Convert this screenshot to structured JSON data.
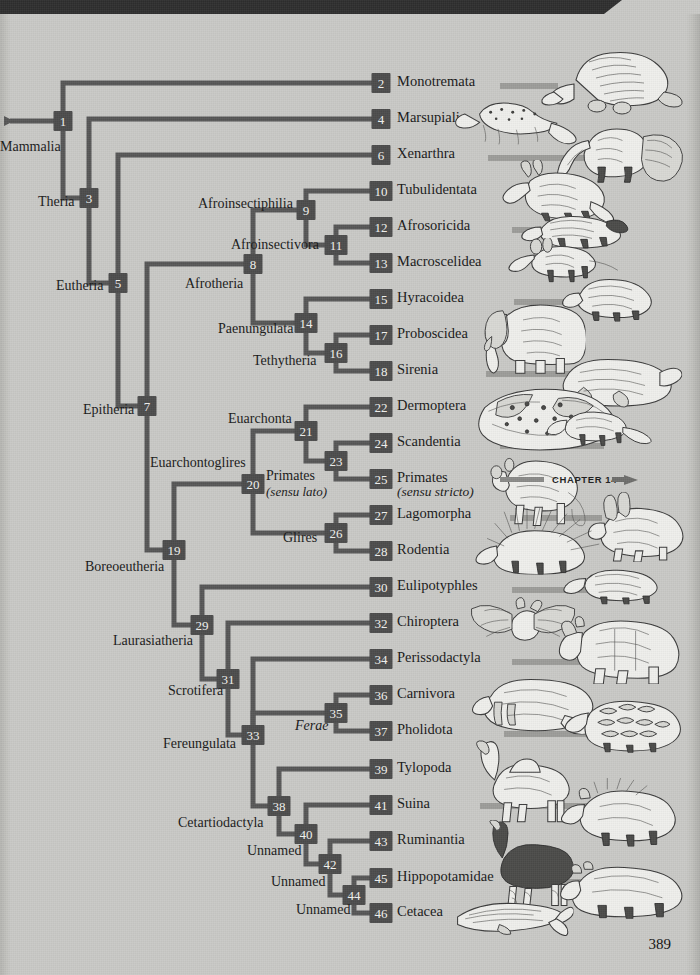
{
  "page": {
    "number": "389",
    "background_color": "#c9c9c6",
    "node_color": "#4b4b4b",
    "branch_color": "#565656"
  },
  "root": {
    "label": "Mammalia"
  },
  "chapter_pointer": {
    "label": "CHAPTER 14"
  },
  "chart_data": {
    "type": "diagram",
    "subtype": "cladogram",
    "leaf_spacing_px": 36,
    "nodes": [
      {
        "id": "1",
        "clade": "Mammalia",
        "type": "internal",
        "x": 63,
        "y": 121,
        "children": [
          "2",
          "3"
        ]
      },
      {
        "id": "2",
        "clade": "Monotremata",
        "type": "leaf",
        "x": 381,
        "y": 83
      },
      {
        "id": "3",
        "clade": "Theria",
        "type": "internal",
        "x": 89,
        "y": 198,
        "children": [
          "4",
          "5"
        ]
      },
      {
        "id": "4",
        "clade": "Marsupialia",
        "type": "leaf",
        "x": 381,
        "y": 119
      },
      {
        "id": "5",
        "clade": "Eutheria",
        "type": "internal",
        "x": 118,
        "y": 283,
        "children": [
          "6",
          "7"
        ]
      },
      {
        "id": "6",
        "clade": "Xenarthra",
        "type": "leaf",
        "x": 381,
        "y": 155
      },
      {
        "id": "7",
        "clade": "Epitheria",
        "type": "internal",
        "x": 147,
        "y": 406,
        "children": [
          "8",
          "19"
        ]
      },
      {
        "id": "8",
        "clade": "Afrotheria",
        "type": "internal",
        "x": 253,
        "y": 264,
        "children": [
          "9",
          "14"
        ]
      },
      {
        "id": "9",
        "clade": "Afroinsectiphilia",
        "type": "internal",
        "x": 306,
        "y": 210,
        "children": [
          "10",
          "11"
        ]
      },
      {
        "id": "10",
        "clade": "Tubulidentata",
        "type": "leaf",
        "x": 381,
        "y": 191
      },
      {
        "id": "11",
        "clade": "Afroinsectivora",
        "type": "internal",
        "x": 336,
        "y": 245,
        "children": [
          "12",
          "13"
        ]
      },
      {
        "id": "12",
        "clade": "Afrosoricida",
        "type": "leaf",
        "x": 381,
        "y": 227
      },
      {
        "id": "13",
        "clade": "Macroscelidea",
        "type": "leaf",
        "x": 381,
        "y": 263
      },
      {
        "id": "14",
        "clade": "Paenungulata",
        "type": "internal",
        "x": 306,
        "y": 323,
        "children": [
          "15",
          "16"
        ]
      },
      {
        "id": "15",
        "clade": "Hyracoidea",
        "type": "leaf",
        "x": 381,
        "y": 299
      },
      {
        "id": "16",
        "clade": "Tethytheria",
        "type": "internal",
        "x": 336,
        "y": 353,
        "children": [
          "17",
          "18"
        ]
      },
      {
        "id": "17",
        "clade": "Proboscidea",
        "type": "leaf",
        "x": 381,
        "y": 335
      },
      {
        "id": "18",
        "clade": "Sirenia",
        "type": "leaf",
        "x": 381,
        "y": 371
      },
      {
        "id": "19",
        "clade": "Boreoeutheria",
        "type": "internal",
        "x": 174,
        "y": 550,
        "children": [
          "20",
          "29"
        ]
      },
      {
        "id": "20",
        "clade": "Euarchontoglires",
        "type": "internal",
        "x": 253,
        "y": 484,
        "children": [
          "21",
          "26"
        ]
      },
      {
        "id": "21",
        "clade": "Euarchonta",
        "type": "internal",
        "x": 306,
        "y": 431,
        "children": [
          "22",
          "23"
        ]
      },
      {
        "id": "22",
        "clade": "Dermoptera",
        "type": "leaf",
        "x": 381,
        "y": 407
      },
      {
        "id": "23",
        "clade": "Primates (sensu lato)",
        "type": "internal",
        "x": 336,
        "y": 461,
        "children": [
          "24",
          "25"
        ]
      },
      {
        "id": "24",
        "clade": "Scandentia",
        "type": "leaf",
        "x": 381,
        "y": 443
      },
      {
        "id": "25",
        "clade": "Primates (sensu stricto)",
        "type": "leaf",
        "x": 381,
        "y": 479
      },
      {
        "id": "26",
        "clade": "Glires",
        "type": "internal",
        "x": 336,
        "y": 533,
        "children": [
          "27",
          "28"
        ]
      },
      {
        "id": "27",
        "clade": "Lagomorpha",
        "type": "leaf",
        "x": 381,
        "y": 515
      },
      {
        "id": "28",
        "clade": "Rodentia",
        "type": "leaf",
        "x": 381,
        "y": 551
      },
      {
        "id": "29",
        "clade": "Laurasiatheria",
        "type": "internal",
        "x": 202,
        "y": 625,
        "children": [
          "30",
          "31"
        ]
      },
      {
        "id": "30",
        "clade": "Eulipotyphles",
        "type": "leaf",
        "x": 381,
        "y": 587
      },
      {
        "id": "31",
        "clade": "Scrotifera",
        "type": "internal",
        "x": 228,
        "y": 679,
        "children": [
          "32",
          "33"
        ]
      },
      {
        "id": "32",
        "clade": "Chiroptera",
        "type": "leaf",
        "x": 381,
        "y": 623
      },
      {
        "id": "33",
        "clade": "Fereungulata",
        "type": "internal",
        "x": 253,
        "y": 735,
        "children": [
          "34",
          "35",
          "38"
        ]
      },
      {
        "id": "34",
        "clade": "Perissodactyla",
        "type": "leaf",
        "x": 381,
        "y": 659
      },
      {
        "id": "35",
        "clade": "Ferae",
        "type": "internal",
        "x": 336,
        "y": 713,
        "children": [
          "36",
          "37"
        ]
      },
      {
        "id": "36",
        "clade": "Carnivora",
        "type": "leaf",
        "x": 381,
        "y": 695
      },
      {
        "id": "37",
        "clade": "Pholidota",
        "type": "leaf",
        "x": 381,
        "y": 731
      },
      {
        "id": "38",
        "clade": "Cetartiodactyla",
        "type": "internal",
        "x": 279,
        "y": 806,
        "children": [
          "39",
          "40"
        ]
      },
      {
        "id": "39",
        "clade": "Tylopoda",
        "type": "leaf",
        "x": 381,
        "y": 769
      },
      {
        "id": "40",
        "clade": "Unnamed",
        "type": "internal",
        "x": 306,
        "y": 834,
        "children": [
          "41",
          "42"
        ]
      },
      {
        "id": "41",
        "clade": "Suina",
        "type": "leaf",
        "x": 381,
        "y": 805
      },
      {
        "id": "42",
        "clade": "Unnamed",
        "type": "internal",
        "x": 330,
        "y": 864,
        "children": [
          "43",
          "44"
        ]
      },
      {
        "id": "43",
        "clade": "Ruminantia",
        "type": "leaf",
        "x": 381,
        "y": 841
      },
      {
        "id": "44",
        "clade": "Unnamed",
        "type": "internal",
        "x": 354,
        "y": 895,
        "children": [
          "45",
          "46"
        ]
      },
      {
        "id": "45",
        "clade": "Hippopotamidae",
        "type": "leaf",
        "x": 381,
        "y": 878
      },
      {
        "id": "46",
        "clade": "Cetacea",
        "type": "leaf",
        "x": 381,
        "y": 913
      }
    ]
  },
  "leaves": [
    {
      "num": "2",
      "name": "Monotremata",
      "sub": "",
      "y": 83,
      "animal": "platypus-illustration"
    },
    {
      "num": "4",
      "name": "Marsupialia",
      "sub": "",
      "y": 119,
      "animal": "quoll-illustration"
    },
    {
      "num": "6",
      "name": "Xenarthra",
      "sub": "",
      "y": 155,
      "animal": "anteater-illustration"
    },
    {
      "num": "10",
      "name": "Tubulidentata",
      "sub": "",
      "y": 191,
      "animal": "aardvark-illustration"
    },
    {
      "num": "12",
      "name": "Afrosoricida",
      "sub": "",
      "y": 227,
      "animal": "tenrec-illustration"
    },
    {
      "num": "13",
      "name": "Macroscelidea",
      "sub": "",
      "y": 263,
      "animal": "elephant-shrew-illustration"
    },
    {
      "num": "15",
      "name": "Hyracoidea",
      "sub": "",
      "y": 299,
      "animal": "hyrax-illustration"
    },
    {
      "num": "17",
      "name": "Proboscidea",
      "sub": "",
      "y": 335,
      "animal": "elephant-illustration"
    },
    {
      "num": "18",
      "name": "Sirenia",
      "sub": "",
      "y": 371,
      "animal": "manatee-illustration"
    },
    {
      "num": "22",
      "name": "Dermoptera",
      "sub": "",
      "y": 407,
      "animal": "colugo-illustration"
    },
    {
      "num": "24",
      "name": "Scandentia",
      "sub": "",
      "y": 443,
      "animal": "treeshrew-illustration"
    },
    {
      "num": "25",
      "name": "Primates",
      "sub": "(sensu stricto)",
      "y": 479,
      "animal": "monkey-illustration"
    },
    {
      "num": "27",
      "name": "Lagomorpha",
      "sub": "",
      "y": 515,
      "animal": "hare-illustration"
    },
    {
      "num": "28",
      "name": "Rodentia",
      "sub": "",
      "y": 551,
      "animal": "porcupine-illustration"
    },
    {
      "num": "30",
      "name": "Eulipotyphles",
      "sub": "",
      "y": 587,
      "animal": "shrew-illustration"
    },
    {
      "num": "32",
      "name": "Chiroptera",
      "sub": "",
      "y": 623,
      "animal": "bat-illustration"
    },
    {
      "num": "34",
      "name": "Perissodactyla",
      "sub": "",
      "y": 659,
      "animal": "rhinoceros-illustration"
    },
    {
      "num": "36",
      "name": "Carnivora",
      "sub": "",
      "y": 695,
      "animal": "walrus-illustration"
    },
    {
      "num": "37",
      "name": "Pholidota",
      "sub": "",
      "y": 731,
      "animal": "pangolin-illustration"
    },
    {
      "num": "39",
      "name": "Tylopoda",
      "sub": "",
      "y": 769,
      "animal": "camel-illustration"
    },
    {
      "num": "41",
      "name": "Suina",
      "sub": "",
      "y": 805,
      "animal": "boar-illustration"
    },
    {
      "num": "43",
      "name": "Ruminantia",
      "sub": "",
      "y": 841,
      "animal": "okapi-illustration"
    },
    {
      "num": "45",
      "name": "Hippopotamidae",
      "sub": "",
      "y": 878,
      "animal": "hippopotamus-illustration"
    },
    {
      "num": "46",
      "name": "Cetacea",
      "sub": "",
      "y": 913,
      "animal": "whale-illustration"
    }
  ],
  "clade_labels": [
    {
      "text": "Mammalia",
      "sub": "",
      "x": 0,
      "y": 148,
      "align": "left"
    },
    {
      "text": "Theria",
      "sub": "",
      "x": 38,
      "y": 203,
      "align": "left"
    },
    {
      "text": "Eutheria",
      "sub": "",
      "x": 56,
      "y": 287,
      "align": "left"
    },
    {
      "text": "Epitheria",
      "sub": "",
      "x": 83,
      "y": 411,
      "align": "left"
    },
    {
      "text": "Boreoeutheria",
      "sub": "",
      "x": 85,
      "y": 568,
      "align": "left"
    },
    {
      "text": "Afrotheria",
      "sub": "",
      "x": 185,
      "y": 285,
      "align": "left"
    },
    {
      "text": "Afroinsectivora",
      "sub": "",
      "x": 231,
      "y": 246,
      "align": "left"
    },
    {
      "text": "Afroinsectiphilia",
      "sub": "",
      "x": 198,
      "y": 205,
      "align": "left"
    },
    {
      "text": "Paenungulata",
      "sub": "",
      "x": 218,
      "y": 330,
      "align": "left"
    },
    {
      "text": "Tethytheria",
      "sub": "",
      "x": 253,
      "y": 362,
      "align": "left"
    },
    {
      "text": "Euarchontoglires",
      "sub": "",
      "x": 150,
      "y": 464,
      "align": "left"
    },
    {
      "text": "Euarchonta",
      "sub": "",
      "x": 228,
      "y": 420,
      "align": "left"
    },
    {
      "text": "Primates",
      "sub": "(sensu lato)",
      "x": 266,
      "y": 477,
      "align": "left"
    },
    {
      "text": "Glires",
      "sub": "",
      "x": 283,
      "y": 539,
      "align": "left"
    },
    {
      "text": "Laurasiatheria",
      "sub": "",
      "x": 113,
      "y": 642,
      "align": "left"
    },
    {
      "text": "Scrotifera",
      "sub": "",
      "x": 168,
      "y": 692,
      "align": "left"
    },
    {
      "text": "Fereungulata",
      "sub": "",
      "x": 163,
      "y": 745,
      "align": "left"
    },
    {
      "text": "Ferae",
      "sub": "",
      "x": 295,
      "y": 727,
      "align": "left",
      "italic": true
    },
    {
      "text": "Cetartiodactyla",
      "sub": "",
      "x": 178,
      "y": 824,
      "align": "left"
    },
    {
      "text": "Unnamed",
      "sub": "",
      "x": 247,
      "y": 852,
      "align": "left"
    },
    {
      "text": "Unnamed",
      "sub": "",
      "x": 271,
      "y": 883,
      "align": "left"
    },
    {
      "text": "Unnamed",
      "sub": "",
      "x": 296,
      "y": 911,
      "align": "left"
    }
  ]
}
